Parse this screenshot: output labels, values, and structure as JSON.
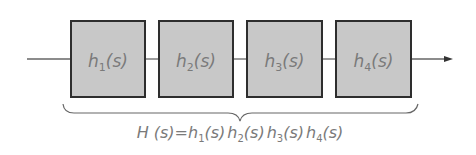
{
  "diagram": {
    "type": "block-diagram-cascade",
    "blocks": [
      {
        "name": "h",
        "sub": "1",
        "arg": "(s)"
      },
      {
        "name": "h",
        "sub": "2",
        "arg": "(s)"
      },
      {
        "name": "h",
        "sub": "3",
        "arg": "(s)"
      },
      {
        "name": "h",
        "sub": "4",
        "arg": "(s)"
      }
    ],
    "formula": {
      "lhs": "H (s)",
      "eq": "=",
      "terms": [
        {
          "name": "h",
          "sub": "1",
          "arg": "(s)"
        },
        {
          "name": "h",
          "sub": "2",
          "arg": "(s)"
        },
        {
          "name": "h",
          "sub": "3",
          "arg": "(s)"
        },
        {
          "name": "h",
          "sub": "4",
          "arg": "(s)"
        }
      ]
    },
    "colors": {
      "block_fill": "#c8c8c8",
      "block_stroke": "#2e2e2e",
      "line": "#666666",
      "text": "#7a7a7a"
    }
  }
}
